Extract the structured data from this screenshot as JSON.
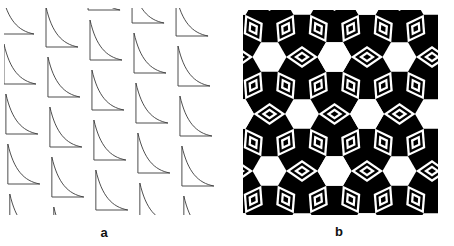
{
  "figure": {
    "background_color": "#ffffff",
    "width": 454,
    "height": 246
  },
  "panels": [
    {
      "id": "a",
      "label": "a",
      "caption_label": "a",
      "kind": "line-tessellation",
      "description": "Sheared repeating lattice of curved-hypotenuse triangle outlines drawn as thin dark strokes on a white ground",
      "stroke_color": "#3a3a3a",
      "fill_color": "none",
      "background_color": "#ffffff",
      "stroke_width": 0.9,
      "lattice": {
        "period_x": 44,
        "period_y": 50,
        "shear_x_per_row": 0,
        "row_offset_y": 13,
        "columns": 5,
        "rows": 5
      },
      "motif": {
        "name": "curved-triangle",
        "apex": [
          0,
          0
        ],
        "foot": [
          0,
          40
        ],
        "base_end": [
          32,
          40
        ],
        "curve_control": [
          9,
          16
        ]
      }
    },
    {
      "id": "b",
      "label": "b",
      "caption_label": "b",
      "kind": "hexagonal-tessellation",
      "description": "Black-and-white hexagonal tessellation: white hexagons on a black ground with concentric nested rhombus chevron bands alternating black and white",
      "background_color": "#000000",
      "ink_color": "#000000",
      "paper_color": "#ffffff",
      "lattice": {
        "hex_pitch_x": 65,
        "hex_pitch_y": 57,
        "hex_radius": 17,
        "columns": 4,
        "rows": 5
      },
      "bands": {
        "count": 4,
        "band_width": 3.2,
        "colors": [
          "#ffffff",
          "#000000",
          "#ffffff",
          "#000000"
        ]
      }
    }
  ],
  "labels": {
    "panel_a": "a",
    "panel_b": "b"
  }
}
